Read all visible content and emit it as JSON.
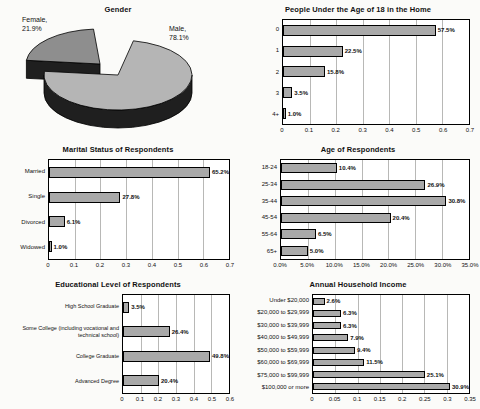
{
  "style": {
    "paper": "#fbfbf9",
    "bar_fill": "#a9a9a9",
    "bar_border": "#000000",
    "plot_background": "#ffffff",
    "gridline_color": "#b8b8b6",
    "pie_male_fill": "#b5b5b5",
    "pie_female_fill": "#8e8e8e",
    "pie_side_fill": "#1f1f1f"
  },
  "chart_data": [
    {
      "type": "pie",
      "title": "Gender",
      "legend_position": "none",
      "slices": [
        {
          "label": "Male",
          "value": 78.1,
          "name_line": "Male,",
          "pct_line": "78.1%",
          "color": "#b5b5b5"
        },
        {
          "label": "Female",
          "value": 21.9,
          "name_line": "Female,",
          "pct_line": "21.9%",
          "color": "#8e8e8e"
        }
      ]
    },
    {
      "type": "bar",
      "title": "People Under the Age of 18 in the Home",
      "categories": [
        "0",
        "1",
        "2",
        "3",
        "4+"
      ],
      "values": [
        0.575,
        0.225,
        0.158,
        0.035,
        0.01
      ],
      "value_labels": [
        "57.5%",
        "22.5%",
        "15.8%",
        "3.5%",
        "1.0%"
      ],
      "xlim": [
        0,
        0.7
      ],
      "ticks": [
        "0",
        "0.1",
        "0.2",
        "0.3",
        "0.4",
        "0.5",
        "0.6",
        "0.7"
      ],
      "orientation": "horizontal",
      "grid": "vertical"
    },
    {
      "type": "bar",
      "title": "Marital Status of Respondents",
      "categories": [
        "Married",
        "Single",
        "Divorced",
        "Widowed"
      ],
      "values": [
        0.652,
        0.278,
        0.061,
        0.01
      ],
      "value_labels": [
        "65.2%",
        "27.8%",
        "6.1%",
        "1.0%"
      ],
      "xlim": [
        0,
        0.7
      ],
      "ticks": [
        "0",
        "0.1",
        "0.2",
        "0.3",
        "0.4",
        "0.5",
        "0.6",
        "0.7"
      ],
      "orientation": "horizontal",
      "grid": "vertical"
    },
    {
      "type": "bar",
      "title": "Age of Respondents",
      "categories": [
        "18-24",
        "25-34",
        "35-44",
        "45-54",
        "55-64",
        "65+"
      ],
      "values": [
        10.4,
        26.9,
        30.8,
        20.4,
        6.5,
        5.0
      ],
      "value_labels": [
        "10.4%",
        "26.9%",
        "30.8%",
        "20.4%",
        "6.5%",
        "5.0%"
      ],
      "xlim": [
        0,
        35
      ],
      "ticks": [
        "0.0%",
        "5.0%",
        "10.0%",
        "15.0%",
        "20.0%",
        "25.0%",
        "30.0%",
        "35.0%"
      ],
      "orientation": "horizontal",
      "grid": "vertical"
    },
    {
      "type": "bar",
      "title": "Educational Level of Respondents",
      "categories": [
        "High School Graduate",
        "Some College (including vocational and technical school)",
        "College Graduate",
        "Advanced Degree"
      ],
      "values": [
        0.035,
        0.264,
        0.498,
        0.204
      ],
      "value_labels": [
        "3.5%",
        "26.4%",
        "49.8%",
        "20.4%"
      ],
      "xlim": [
        0,
        0.6
      ],
      "ticks": [
        "0",
        "0.1",
        "0.2",
        "0.3",
        "0.4",
        "0.5",
        "0.6"
      ],
      "orientation": "horizontal",
      "grid": "vertical"
    },
    {
      "type": "bar",
      "title": "Annual Household Income",
      "categories": [
        "Under $20,000",
        "$20,000 to $29,999",
        "$30,000 to $39,999",
        "$40,000 to $49,999",
        "$50,000 to $59,999",
        "$60,000 to $69,999",
        "$75,000 to $99,999",
        "$100,000 or more"
      ],
      "values": [
        0.026,
        0.063,
        0.063,
        0.079,
        0.094,
        0.115,
        0.251,
        0.309
      ],
      "value_labels": [
        "2.6%",
        "6.3%",
        "6.3%",
        "7.9%",
        "9.4%",
        "11.5%",
        "25.1%",
        "30.9%"
      ],
      "xlim": [
        0,
        0.35
      ],
      "ticks": [
        "0",
        "0.05",
        "0.1",
        "0.15",
        "0.2",
        "0.25",
        "0.3",
        "0.35"
      ],
      "orientation": "horizontal",
      "grid": "vertical"
    }
  ]
}
